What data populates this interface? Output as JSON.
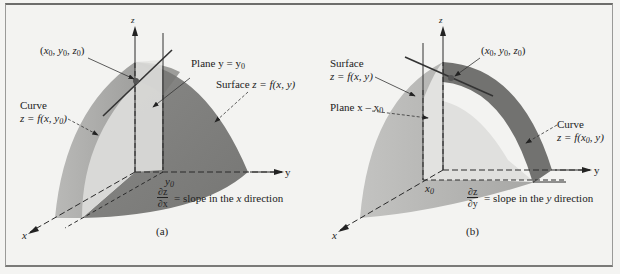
{
  "figure_a": {
    "caption": "(a)",
    "axes": {
      "x": "x",
      "y": "y",
      "z": "z"
    },
    "point_label": [
      "(",
      "x",
      "0",
      ", ",
      "y",
      "0",
      ", ",
      "z",
      "0",
      ")"
    ],
    "point_text": "(x0, y0, z0)",
    "plane_label_prefix": "Plane y = y",
    "plane_label_sub": "0",
    "surface_label_prefix": "Surface ",
    "surface_label_eq": "z = f(x, y)",
    "curve_label_line1": "Curve",
    "curve_label_line2_prefix": "z = f(x, y",
    "curve_label_line2_sub": "0",
    "curve_label_line2_suffix": ")",
    "y0_label": "y",
    "y0_sub": "0",
    "derivative_num": "∂z",
    "derivative_den": "∂x",
    "derivative_text_prefix": "= slope in the ",
    "derivative_text_var": "x",
    "derivative_text_suffix": " direction"
  },
  "figure_b": {
    "caption": "(b)",
    "axes": {
      "x": "x",
      "y": "y",
      "z": "z"
    },
    "point_text": "(x0, y0, z0)",
    "surface_label_line1": "Surface",
    "surface_label_line2": "z = f(x, y)",
    "plane_label_prefix": "Plane x – x",
    "plane_label_sub": "0",
    "curve_label_line1": "Curve",
    "curve_label_line2_prefix": "z = f(x",
    "curve_label_line2_sub": "0",
    "curve_label_line2_suffix": ", y)",
    "x0_label": "x",
    "x0_sub": "0",
    "derivative_num": "∂z",
    "derivative_den": "∂y",
    "derivative_text_prefix": "= slope in the ",
    "derivative_text_var": "y",
    "derivative_text_suffix": " direction"
  },
  "colors": {
    "background": "#f3f3f1",
    "surface_dark": "#8a8a88",
    "surface_mid": "#a9a9a7",
    "surface_light": "#d2d2d0",
    "plane_fill": "#e2e2e0",
    "band_dark": "#6e6e6c",
    "line": "#2a2a2a"
  }
}
